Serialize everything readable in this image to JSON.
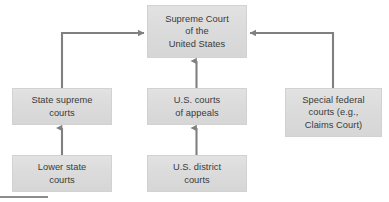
{
  "diagram": {
    "type": "flowchart",
    "colors": {
      "box_fill_top": "#e2e2e2",
      "box_fill_bottom": "#d6d6d6",
      "box_border": "#d2d2d2",
      "text": "#3a3a3a",
      "connector": "#808080",
      "footer_rule": "#8c8c8c",
      "background": "#ffffff"
    },
    "nodes": [
      {
        "id": "supreme-court",
        "label": "Supreme Court\nof the\nUnited States",
        "lines": [
          "Supreme Court",
          "of the",
          "United States"
        ],
        "x": 147,
        "y": 5,
        "width": 100,
        "height": 53
      },
      {
        "id": "state-supreme-courts",
        "label": "State supreme\ncourts",
        "lines": [
          "State supreme",
          "courts"
        ],
        "x": 12,
        "y": 88,
        "width": 100,
        "height": 37
      },
      {
        "id": "us-courts-of-appeals",
        "label": "U.S. courts\nof appeals",
        "lines": [
          "U.S. courts",
          "of appeals"
        ],
        "x": 147,
        "y": 88,
        "width": 100,
        "height": 37
      },
      {
        "id": "special-federal-courts",
        "label": "Special federal\ncourts (e.g.,\nClaims Court)",
        "lines": [
          "Special federal",
          "courts (e.g.,",
          "Claims Court)"
        ],
        "x": 285,
        "y": 88,
        "width": 97,
        "height": 49
      },
      {
        "id": "lower-state-courts",
        "label": "Lower state\ncourts",
        "lines": [
          "Lower state",
          "courts"
        ],
        "x": 12,
        "y": 155,
        "width": 100,
        "height": 37
      },
      {
        "id": "us-district-courts",
        "label": "U.S. district\ncourts",
        "lines": [
          "U.S. district",
          "courts"
        ],
        "x": 147,
        "y": 155,
        "width": 100,
        "height": 37
      }
    ],
    "edges": [
      {
        "id": "edge-state-supreme-to-supreme-court",
        "from": "state-supreme-courts",
        "to": "supreme-court",
        "shape": "elbow-up-right",
        "arrowhead": "right"
      },
      {
        "id": "edge-appeals-to-supreme-court",
        "from": "us-courts-of-appeals",
        "to": "supreme-court",
        "shape": "vertical",
        "arrowhead": "up"
      },
      {
        "id": "edge-special-federal-to-supreme-court",
        "from": "special-federal-courts",
        "to": "supreme-court",
        "shape": "elbow-up-left",
        "arrowhead": "left"
      },
      {
        "id": "edge-lower-state-to-state-supreme",
        "from": "lower-state-courts",
        "to": "state-supreme-courts",
        "shape": "vertical",
        "arrowhead": "up"
      },
      {
        "id": "edge-district-to-appeals",
        "from": "us-district-courts",
        "to": "us-courts-of-appeals",
        "shape": "vertical",
        "arrowhead": "up"
      }
    ]
  }
}
